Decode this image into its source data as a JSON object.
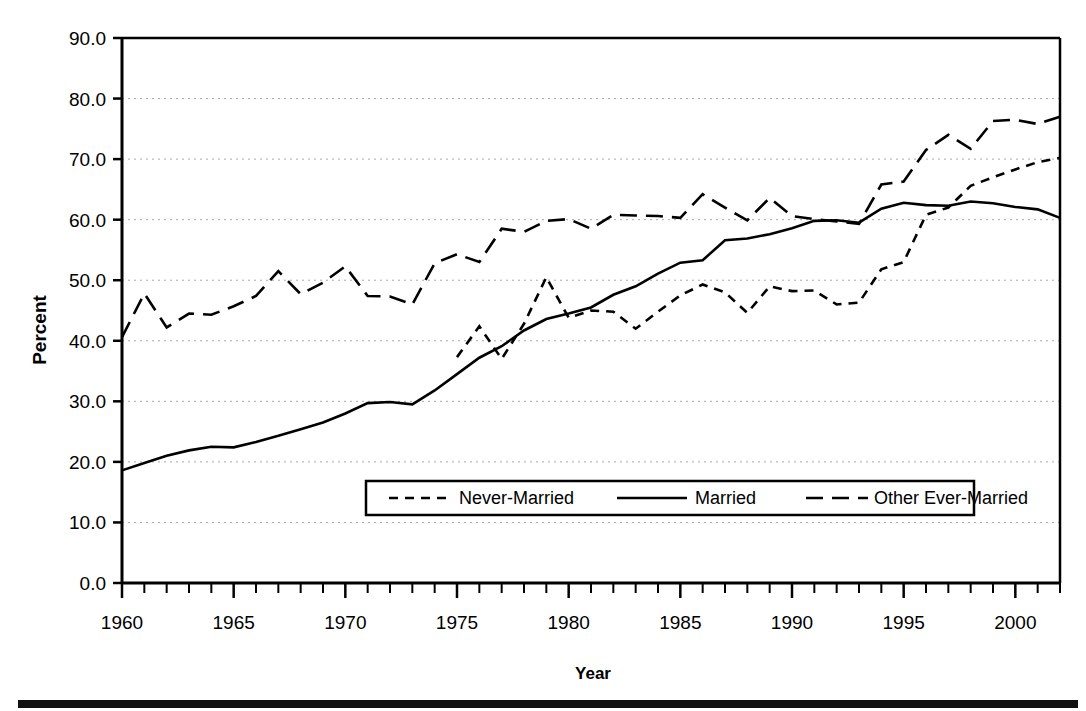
{
  "chart_data": {
    "type": "line",
    "title": "",
    "xlabel": "Year",
    "ylabel": "Percent",
    "xlim": [
      1960,
      2002
    ],
    "ylim": [
      0.0,
      90.0
    ],
    "grid": true,
    "legend_position": "inside-lower-center",
    "x": [
      1960,
      1961,
      1962,
      1963,
      1964,
      1965,
      1966,
      1967,
      1968,
      1969,
      1970,
      1971,
      1972,
      1973,
      1974,
      1975,
      1976,
      1977,
      1978,
      1979,
      1980,
      1981,
      1982,
      1983,
      1984,
      1985,
      1986,
      1987,
      1988,
      1989,
      1990,
      1991,
      1992,
      1993,
      1994,
      1995,
      1996,
      1997,
      1998,
      1999,
      2000,
      2001,
      2002
    ],
    "xticklabels": [
      "1960",
      "1965",
      "1970",
      "1975",
      "1980",
      "1985",
      "1990",
      "1995",
      "2000"
    ],
    "xticks_major": [
      1960,
      1965,
      1970,
      1975,
      1980,
      1985,
      1990,
      1995,
      2000
    ],
    "yticklabels": [
      "0.0",
      "10.0",
      "20.0",
      "30.0",
      "40.0",
      "50.0",
      "60.0",
      "70.0",
      "80.0",
      "90.0"
    ],
    "yticks": [
      0.0,
      10.0,
      20.0,
      30.0,
      40.0,
      50.0,
      60.0,
      70.0,
      80.0,
      90.0
    ],
    "series": [
      {
        "name": "Never-Married",
        "style": "short-dashed",
        "color": "#000000",
        "values": [
          null,
          null,
          null,
          null,
          null,
          null,
          null,
          null,
          null,
          null,
          null,
          null,
          null,
          null,
          null,
          37.3,
          42.4,
          37.0,
          42.8,
          50.5,
          43.8,
          45.0,
          44.8,
          42.0,
          44.8,
          47.5,
          49.3,
          48.0,
          44.6,
          49.0,
          48.2,
          48.3,
          46.0,
          46.3,
          51.8,
          53.0,
          60.8,
          62.0,
          65.6,
          67.0,
          68.3,
          69.5,
          70.2
        ]
      },
      {
        "name": "Married",
        "style": "solid",
        "color": "#000000",
        "values": [
          18.6,
          19.8,
          21.0,
          21.9,
          22.5,
          22.4,
          23.3,
          24.3,
          25.4,
          26.5,
          28.0,
          29.7,
          29.9,
          29.5,
          31.8,
          34.5,
          37.2,
          39.1,
          41.7,
          43.6,
          44.5,
          45.5,
          47.6,
          49.0,
          51.1,
          52.9,
          53.3,
          56.6,
          56.9,
          57.6,
          58.6,
          59.8,
          59.9,
          59.5,
          61.8,
          62.8,
          62.4,
          62.3,
          63.0,
          62.7,
          62.1,
          61.7,
          60.3
        ]
      },
      {
        "name": "Other Ever-Married",
        "style": "long-dashed",
        "color": "#000000",
        "values": [
          40.6,
          47.8,
          42.2,
          44.5,
          44.3,
          45.7,
          47.4,
          51.5,
          47.7,
          49.6,
          52.3,
          47.4,
          47.3,
          46.0,
          52.8,
          54.3,
          53.0,
          58.5,
          58.0,
          59.8,
          60.1,
          58.5,
          60.8,
          60.7,
          60.6,
          60.3,
          64.2,
          62.0,
          59.9,
          63.6,
          60.6,
          60.1,
          59.7,
          59.3,
          65.8,
          66.3,
          71.5,
          74.0,
          71.7,
          76.3,
          76.5,
          75.8,
          77.0
        ]
      }
    ]
  },
  "axes": {
    "ylabel": "Percent",
    "xlabel": "Year",
    "ytick_labels": [
      "90.0",
      "80.0",
      "70.0",
      "60.0",
      "50.0",
      "40.0",
      "30.0",
      "20.0",
      "10.0",
      "0.0"
    ],
    "xtick_labels": [
      "1960",
      "1965",
      "1970",
      "1975",
      "1980",
      "1985",
      "1990",
      "1995",
      "2000"
    ]
  },
  "legend": {
    "entries": [
      {
        "label": "Never-Married",
        "style": "short-dashed"
      },
      {
        "label": "Married",
        "style": "solid"
      },
      {
        "label": "Other Ever-Married",
        "style": "long-dashed"
      }
    ]
  },
  "colors": {
    "line": "#000000",
    "grid": "#aaaaaa",
    "background": "#ffffff",
    "footer_bar": "#111111"
  }
}
